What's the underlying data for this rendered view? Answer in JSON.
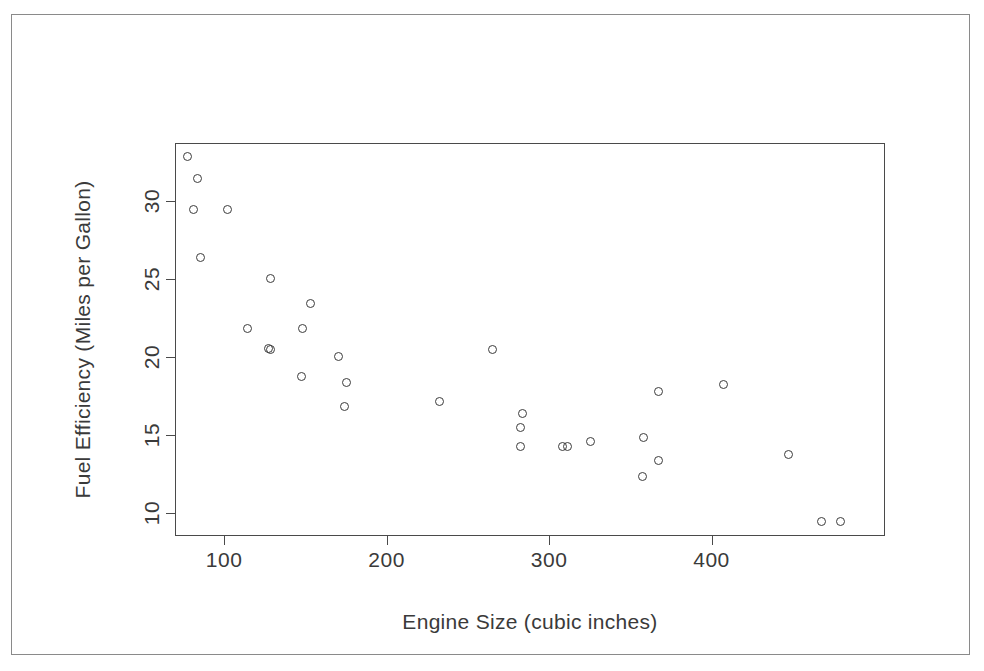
{
  "chart_data": {
    "type": "scatter",
    "title": "",
    "xlabel": "Engine Size (cubic inches)",
    "ylabel": "Fuel Efficiency (Miles per Gallon)",
    "xlim": [
      63,
      500
    ],
    "ylim": [
      9.4,
      34.6
    ],
    "xticks": [
      100,
      200,
      300,
      400
    ],
    "xticklabels": [
      "100",
      "200",
      "300",
      "400"
    ],
    "yticks": [
      10,
      15,
      20,
      25,
      30
    ],
    "yticklabels": [
      "10",
      "15",
      "20",
      "25",
      "30"
    ],
    "grid": false,
    "legend": null,
    "marker": "open-circle",
    "marker_color": "#3c3c3c",
    "points": [
      {
        "x": 70,
        "y": 33.8
      },
      {
        "x": 76,
        "y": 32.4
      },
      {
        "x": 74,
        "y": 30.4
      },
      {
        "x": 95,
        "y": 30.4
      },
      {
        "x": 78,
        "y": 27.3
      },
      {
        "x": 121,
        "y": 26.0
      },
      {
        "x": 146,
        "y": 24.4
      },
      {
        "x": 107,
        "y": 22.8
      },
      {
        "x": 141,
        "y": 22.8
      },
      {
        "x": 120,
        "y": 21.5
      },
      {
        "x": 121,
        "y": 21.4
      },
      {
        "x": 258,
        "y": 21.4
      },
      {
        "x": 163,
        "y": 21.0
      },
      {
        "x": 140,
        "y": 19.7
      },
      {
        "x": 168,
        "y": 19.3
      },
      {
        "x": 167,
        "y": 17.8
      },
      {
        "x": 225,
        "y": 18.1
      },
      {
        "x": 360,
        "y": 18.7
      },
      {
        "x": 400,
        "y": 19.2
      },
      {
        "x": 276,
        "y": 17.3
      },
      {
        "x": 275,
        "y": 16.4
      },
      {
        "x": 275,
        "y": 15.2
      },
      {
        "x": 351,
        "y": 15.8
      },
      {
        "x": 301,
        "y": 15.2
      },
      {
        "x": 304,
        "y": 15.2
      },
      {
        "x": 318,
        "y": 15.5
      },
      {
        "x": 360,
        "y": 14.3
      },
      {
        "x": 440,
        "y": 14.7
      },
      {
        "x": 350,
        "y": 13.3
      },
      {
        "x": 460,
        "y": 10.4
      },
      {
        "x": 472,
        "y": 10.4
      }
    ]
  },
  "figure": {
    "background_color": "#ffffff",
    "frame_color": "#8a8a8a",
    "axis_color": "#4a4a4a",
    "text_color": "#3a3a3a"
  }
}
